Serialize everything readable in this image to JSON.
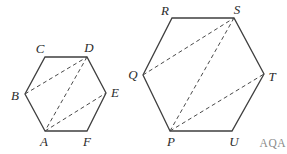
{
  "colors": {
    "background": "#ffffff",
    "outline": "#3f3f3f",
    "diagonal": "#4a4a4a",
    "label": "#2b2b2b",
    "watermark": "#8a8a8a"
  },
  "watermark": {
    "text": "AQA",
    "x": 286,
    "y": 143
  },
  "figures": [
    {
      "name": "hexagon-abcdef",
      "vertices": [
        {
          "label": "A",
          "x": 45,
          "y": 131,
          "label_x": 44,
          "label_y": 141
        },
        {
          "label": "B",
          "x": 25,
          "y": 94,
          "label_x": 15,
          "label_y": 95
        },
        {
          "label": "C",
          "x": 45,
          "y": 57,
          "label_x": 40,
          "label_y": 48
        },
        {
          "label": "D",
          "x": 87,
          "y": 57,
          "label_x": 89,
          "label_y": 47
        },
        {
          "label": "E",
          "x": 106,
          "y": 93,
          "label_x": 115,
          "label_y": 92
        },
        {
          "label": "F",
          "x": 87,
          "y": 131,
          "label_x": 87,
          "label_y": 141
        }
      ],
      "diagonals": [
        [
          "B",
          "D"
        ],
        [
          "D",
          "A"
        ],
        [
          "A",
          "E"
        ]
      ]
    },
    {
      "name": "hexagon-pqrstu",
      "vertices": [
        {
          "label": "P",
          "x": 170,
          "y": 131,
          "label_x": 171,
          "label_y": 141
        },
        {
          "label": "Q",
          "x": 143,
          "y": 75,
          "label_x": 133,
          "label_y": 74
        },
        {
          "label": "R",
          "x": 172,
          "y": 18,
          "label_x": 165,
          "label_y": 10
        },
        {
          "label": "S",
          "x": 234,
          "y": 18,
          "label_x": 237,
          "label_y": 9
        },
        {
          "label": "T",
          "x": 264,
          "y": 74,
          "label_x": 272,
          "label_y": 76
        },
        {
          "label": "U",
          "x": 232,
          "y": 131,
          "label_x": 234,
          "label_y": 141
        }
      ],
      "diagonals": [
        [
          "Q",
          "S"
        ],
        [
          "S",
          "P"
        ],
        [
          "P",
          "T"
        ]
      ]
    }
  ]
}
